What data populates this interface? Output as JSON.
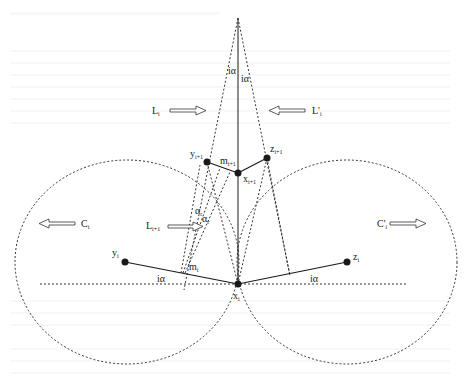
{
  "diagram": {
    "type": "geometric-construction",
    "background_heading": "4.3 The Coordinate Complexity L_i(n)",
    "colors": {
      "ink": "#1a1a1a",
      "dashed": "#333333",
      "background": "#ffffff",
      "ghost_text": "#f0f0f0"
    },
    "points": [
      {
        "id": "x_i",
        "label": "x",
        "sub": "i",
        "x": 238,
        "y": 284
      },
      {
        "id": "y_i",
        "label": "y",
        "sub": "i",
        "x": 125,
        "y": 262
      },
      {
        "id": "z_i",
        "label": "z",
        "sub": "i",
        "x": 347,
        "y": 262
      },
      {
        "id": "x_i1",
        "label": "x",
        "sub": "i+1",
        "x": 238,
        "y": 173
      },
      {
        "id": "y_i1",
        "label": "y",
        "sub": "i+1",
        "x": 207,
        "y": 162
      },
      {
        "id": "z_i1",
        "label": "z",
        "sub": "i+1",
        "x": 267,
        "y": 158
      },
      {
        "id": "m_i",
        "label": "m",
        "sub": "i",
        "x": 181,
        "y": 273
      },
      {
        "id": "m_i1",
        "label": "m",
        "sub": "i+1",
        "x": 224,
        "y": 168
      },
      {
        "id": "apex",
        "label": "",
        "sub": "",
        "x": 238,
        "y": 18
      }
    ],
    "labels": {
      "L_i": {
        "text": "L",
        "sub": "i"
      },
      "L_prime_i": {
        "text": "L'",
        "sub": "i"
      },
      "L_i1": {
        "text": "L",
        "sub": "i+1"
      },
      "C_i": {
        "text": "C",
        "sub": "i"
      },
      "C_prime_i": {
        "text": "C'",
        "sub": "i"
      },
      "angle_top_left": "iα",
      "angle_top_right": "iα",
      "angle_bottom_left": "iα",
      "angle_bottom_right": "iα",
      "alpha_r1": "α",
      "alpha_r1_sub": "r",
      "alpha_r2": "α",
      "alpha_r2_sub": "r"
    },
    "circles": [
      {
        "name": "C_i",
        "cx": 127,
        "cy": 262,
        "rx": 112,
        "ry": 102
      },
      {
        "name": "C_prime_i",
        "cx": 347,
        "cy": 262,
        "rx": 110,
        "ry": 102
      }
    ]
  }
}
